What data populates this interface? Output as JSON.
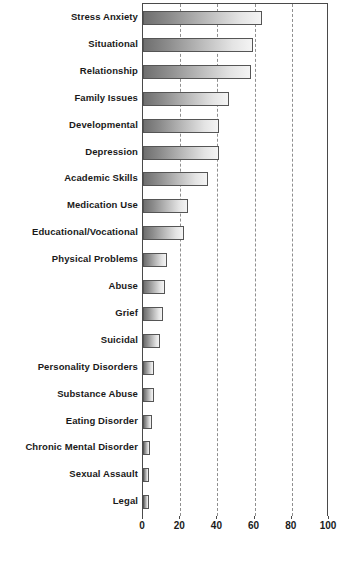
{
  "chart_data": {
    "type": "bar",
    "orientation": "horizontal",
    "title": "",
    "subtitle": "",
    "xlabel": "",
    "ylabel": "",
    "xlim": [
      0,
      100
    ],
    "xticks": [
      0,
      20,
      40,
      60,
      80,
      100
    ],
    "xtick_labels": [
      "0",
      "20",
      "40",
      "60",
      "80",
      "100"
    ],
    "grid": "vertical-dashed",
    "legend": "none",
    "categories": [
      "Stress Anxiety",
      "Situational",
      "Relationship",
      "Family Issues",
      "Developmental",
      "Depression",
      "Academic Skills",
      "Medication Use",
      "Educational/Vocational",
      "Physical Problems",
      "Abuse",
      "Grief",
      "Suicidal",
      "Personality Disorders",
      "Substance Abuse",
      "Eating Disorder",
      "Chronic Mental Disorder",
      "Sexual Assault",
      "Legal"
    ],
    "values": [
      64,
      59,
      58,
      46,
      41,
      41,
      35,
      24,
      22,
      13,
      12,
      11,
      9,
      6,
      6,
      5,
      3.5,
      3,
      3
    ],
    "bar_fill": "#8c8c8c",
    "bar_gradient_from": "#6f6f6f",
    "bar_gradient_to": "#f4f4f4",
    "bar_border": "#555555",
    "axis_color": "#4a4a4a",
    "grid_color": "#8f8f8f",
    "text_color": "#1a1a1a"
  }
}
